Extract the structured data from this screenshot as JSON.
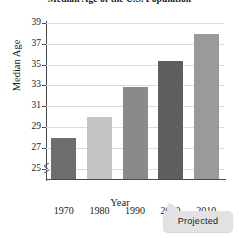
{
  "chart_data": {
    "type": "bar",
    "title": "Median Age of the U.S. Population",
    "xlabel": "Year",
    "ylabel": "Median Age",
    "categories": [
      "1970",
      "1980",
      "1990",
      "2000",
      "2010"
    ],
    "values": [
      27.9,
      30.0,
      32.8,
      35.3,
      37.9
    ],
    "bar_colors": [
      "#6e6e6e",
      "#c4c4c4",
      "#8a8a8a",
      "#5e5e5e",
      "#9a9a9a"
    ],
    "ylim": [
      24,
      39
    ],
    "yticks": [
      25,
      27,
      29,
      31,
      33,
      35,
      37,
      39
    ],
    "ytick_labels": [
      "25",
      "27",
      "29",
      "31",
      "33",
      "35",
      "37",
      "39"
    ],
    "grid": true,
    "axis_break": true,
    "legend": "none",
    "annotations": [
      {
        "text": "Projected",
        "target_category": "2010",
        "style": "callout-bubble"
      }
    ]
  },
  "callout": {
    "label": "Projected"
  }
}
